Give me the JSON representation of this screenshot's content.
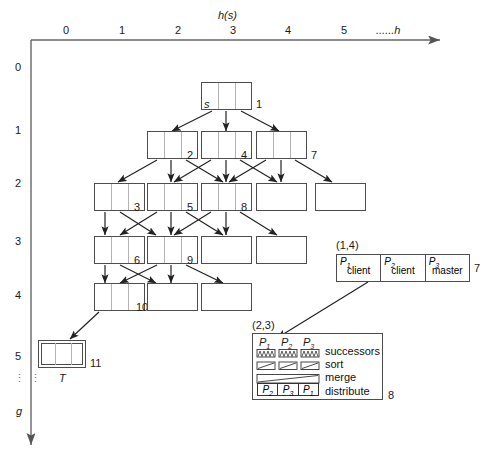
{
  "figure": {
    "type": "diagram"
  },
  "axes": {
    "x_title": "h(s)",
    "x_ticks": [
      "0",
      "1",
      "2",
      "3",
      "4",
      "5"
    ],
    "x_tail": "......h",
    "y_ticks": [
      "0",
      "1",
      "2",
      "3",
      "4",
      "5"
    ],
    "y_dots": "⋮",
    "y_title": "g"
  },
  "nodes": [
    {
      "id": "root",
      "label": "s",
      "number": "1",
      "filled": true
    },
    {
      "id": "r1c2",
      "label": "",
      "number": "2",
      "filled": true
    },
    {
      "id": "r1c3",
      "label": "",
      "number": "4",
      "filled": true
    },
    {
      "id": "r1c4",
      "label": "",
      "number": "7",
      "filled": true
    },
    {
      "id": "r2c1",
      "label": "",
      "number": "3",
      "filled": true
    },
    {
      "id": "r2c2",
      "label": "",
      "number": "5",
      "filled": true
    },
    {
      "id": "r2c3",
      "label": "",
      "number": "8",
      "filled": true
    },
    {
      "id": "r2c4",
      "label": "",
      "number": "",
      "filled": true
    },
    {
      "id": "r2c5",
      "label": "",
      "number": "",
      "filled": false
    },
    {
      "id": "r3c1",
      "label": "",
      "number": "6",
      "filled": true
    },
    {
      "id": "r3c2",
      "label": "",
      "number": "9",
      "filled": true
    },
    {
      "id": "r3c3",
      "label": "",
      "number": "",
      "filled": false
    },
    {
      "id": "r3c4",
      "label": "",
      "number": "",
      "filled": false
    },
    {
      "id": "r4c1",
      "label": "",
      "number": "10",
      "filled": true
    },
    {
      "id": "r4c2",
      "label": "",
      "number": "",
      "filled": false
    },
    {
      "id": "r4c3",
      "label": "",
      "number": "",
      "filled": false
    }
  ],
  "terminal": {
    "label": "T",
    "number": "11"
  },
  "callout_processors": {
    "coord_label": "(1,4)",
    "number": "7",
    "cells": [
      {
        "proc": "P",
        "sub": "1",
        "role": "client"
      },
      {
        "proc": "P",
        "sub": "2",
        "role": "client"
      },
      {
        "proc": "P",
        "sub": "3",
        "role": "master"
      }
    ]
  },
  "legend": {
    "coord_label": "(2,3)",
    "number": "8",
    "headers": [
      {
        "proc": "P",
        "sub": "1"
      },
      {
        "proc": "P",
        "sub": "2"
      },
      {
        "proc": "P",
        "sub": "3"
      }
    ],
    "rows": [
      {
        "name": "successors",
        "icon": "sawtooth-boxes-icon"
      },
      {
        "name": "sort",
        "icon": "diagonal-boxes-icon"
      },
      {
        "name": "merge",
        "icon": "long-diagonal-bar-icon"
      },
      {
        "name": "distribute",
        "icon": "distribute-cells-icon"
      }
    ],
    "distribute_cells": [
      {
        "proc": "P",
        "sub": "2"
      },
      {
        "proc": "P",
        "sub": "3"
      },
      {
        "proc": "P",
        "sub": "1"
      }
    ]
  },
  "colors": {
    "line": "#4d4d4d",
    "arrow": "#222222",
    "cell_divider": "#b3b3b3",
    "text": "#1a1a1a"
  }
}
